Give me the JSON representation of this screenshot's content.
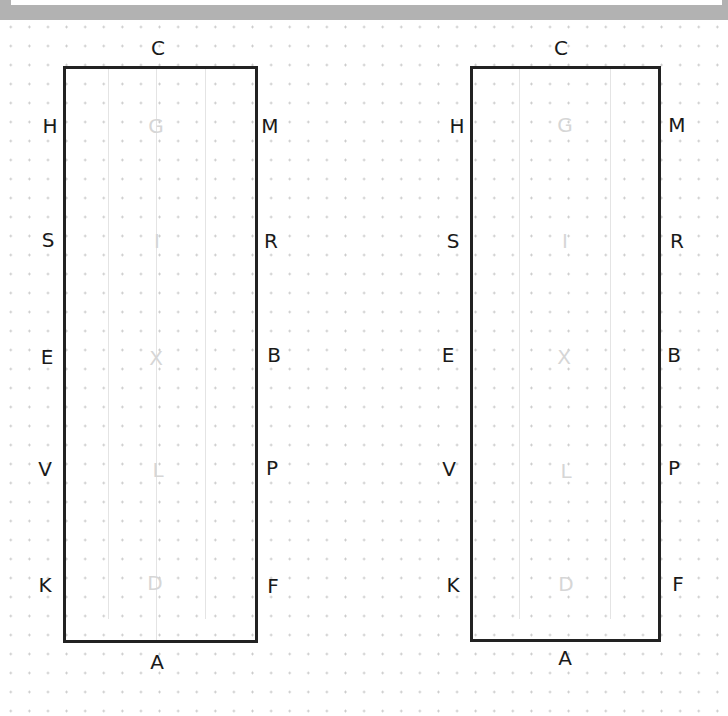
{
  "diagram": {
    "type": "dressage-arena",
    "colors": {
      "border": "#222222",
      "letter": "#1a1a1a",
      "inner_letter": "#d6d6d6",
      "grid_dot": "#c4c4c4",
      "top_band": "#b2b2b2"
    },
    "arenas": [
      {
        "id": "left",
        "top": "C",
        "bottom": "A",
        "left_side": [
          "H",
          "S",
          "E",
          "V",
          "K"
        ],
        "right_side": [
          "M",
          "R",
          "B",
          "P",
          "F"
        ],
        "centerline": [
          "G",
          "I",
          "X",
          "L",
          "D"
        ]
      },
      {
        "id": "right",
        "top": "C",
        "bottom": "A",
        "left_side": [
          "H",
          "S",
          "E",
          "V",
          "K"
        ],
        "right_side": [
          "M",
          "R",
          "B",
          "P",
          "F"
        ],
        "centerline": [
          "G",
          "I",
          "X",
          "L",
          "D"
        ]
      }
    ]
  }
}
